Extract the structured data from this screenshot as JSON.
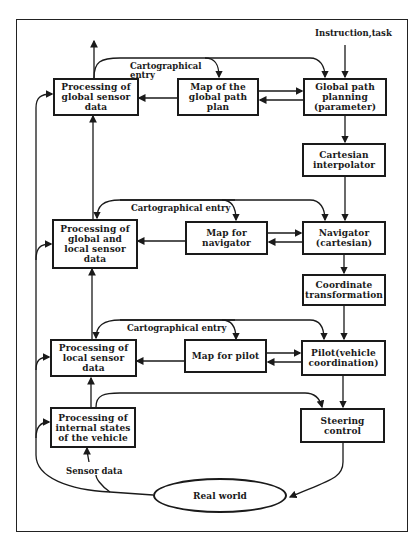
{
  "diagram": {
    "input_label": "Instruction,task",
    "sensor_label": "Sensor data",
    "carto_labels": {
      "top": "Cartographical\n entry",
      "middle": "Cartographical entry",
      "bottom": "Cartographical entry"
    },
    "boxes": {
      "proc_global": "Processing of\nglobal sensor\ndata",
      "map_global": "Map of the\nglobal path\nplan",
      "global_planning": "Global path\nplanning\n(parameter)",
      "cartesian_interp": "Cartesian\ninterpolator",
      "proc_global_local": "Processing of\nglobal and\nlocal sensor\ndata",
      "map_navigator": "Map for\nnavigator",
      "navigator": "Navigator\n(cartesian)",
      "coord_transform": "Coordinate\ntransformation",
      "proc_local": "Processing of\nlocal sensor\ndata",
      "map_pilot": "Map for pilot",
      "pilot": "Pilot(vehicle\ncoordination)",
      "proc_internal": "Processing of\ninternal states\nof the vehicle",
      "steering": "Steering\ncontrol"
    },
    "real_world": "Real world"
  }
}
